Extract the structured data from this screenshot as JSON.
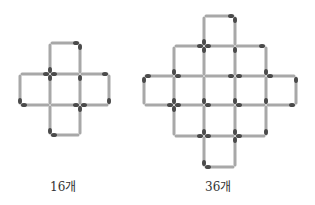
{
  "colors": {
    "stick": "#a8a8a8",
    "head": "#4a4a4a",
    "text": "#333333"
  },
  "figures": [
    {
      "name": "small-cross",
      "label": "16개",
      "xs": [
        20,
        50,
        80,
        109
      ],
      "ys": [
        43,
        74,
        105,
        135
      ],
      "cells": [
        [
          1,
          0
        ],
        [
          0,
          1
        ],
        [
          1,
          1
        ],
        [
          2,
          1
        ],
        [
          1,
          2
        ]
      ]
    },
    {
      "name": "large-diamond",
      "label": "36개",
      "xs": [
        144,
        174,
        204,
        235,
        266,
        296
      ],
      "ys": [
        16,
        46,
        76,
        105,
        136,
        167
      ],
      "cells": [
        [
          2,
          0
        ],
        [
          1,
          1
        ],
        [
          2,
          1
        ],
        [
          3,
          1
        ],
        [
          0,
          2
        ],
        [
          1,
          2
        ],
        [
          2,
          2
        ],
        [
          3,
          2
        ],
        [
          4,
          2
        ],
        [
          1,
          3
        ],
        [
          2,
          3
        ],
        [
          3,
          3
        ],
        [
          2,
          4
        ]
      ]
    }
  ],
  "labels": [
    {
      "text": "16개",
      "x": 50,
      "y": 180
    },
    {
      "text": "36개",
      "x": 205,
      "y": 180
    }
  ]
}
